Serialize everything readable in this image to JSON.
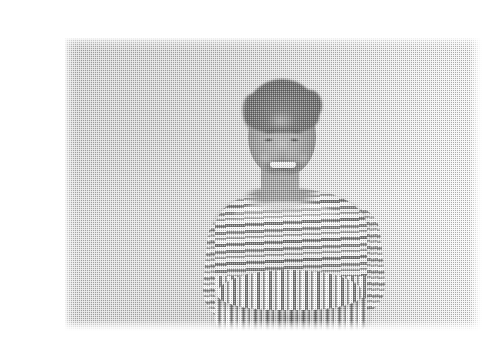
{
  "page": {
    "background_color": "#ffffff",
    "width": 465,
    "height": 337
  },
  "photo": {
    "kind": "halftone-screened grayscale photograph",
    "alt_text": "Smiling woman with hair pulled back, arms crossed, wearing a striped boat-neck top, standing against a plain light wall",
    "frame": {
      "x": 25,
      "y": 22,
      "width": 418,
      "height": 294
    },
    "palette": {
      "page": "#ffffff",
      "wall_light": "#ededed",
      "wall_mid": "#e4e4e4",
      "wall_shadow": "#d8d8d8",
      "skin_light": "#bdbdbd",
      "skin_mid": "#a9a9a9",
      "skin_shadow": "#8e8e8e",
      "hair": "#787878",
      "stripe_light": "#fbfbfb",
      "stripe_dark": "#8b8b8b",
      "stripe_mid": "#a6a6a6"
    },
    "subject": {
      "head": {
        "label": "head"
      },
      "hair": {
        "label": "hair-pulled-back"
      },
      "hair_bun": {
        "label": "hair-bun"
      },
      "eyebrow_left": {
        "label": "eyebrow-left"
      },
      "eyebrow_right": {
        "label": "eyebrow-right"
      },
      "eye_left": {
        "label": "eye-left-smiling"
      },
      "eye_right": {
        "label": "eye-right-smiling"
      },
      "nose": {
        "label": "nose"
      },
      "mouth": {
        "label": "open-smile"
      },
      "teeth": {
        "label": "teeth"
      },
      "chin": {
        "label": "chin"
      },
      "neck": {
        "label": "neck"
      },
      "neckline": {
        "label": "boat-neck-opening"
      },
      "torso": {
        "label": "striped-top-torso"
      },
      "stripes_horizontal": {
        "label": "horizontal-stripes-upper"
      },
      "stripes_vertical": {
        "label": "vertical-stripes-peplum"
      },
      "sleeve_left": {
        "label": "sleeve-left"
      },
      "sleeve_right": {
        "label": "sleeve-right"
      },
      "forearms": {
        "label": "crossed-forearms"
      },
      "hem": {
        "label": "hem-shadow"
      }
    },
    "background": {
      "label": "plain-light-wall"
    },
    "effects": {
      "halftone": {
        "label": "halftone-dot-screen",
        "dot_pitch_px": 2
      },
      "grain": {
        "label": "print-grain"
      }
    }
  }
}
